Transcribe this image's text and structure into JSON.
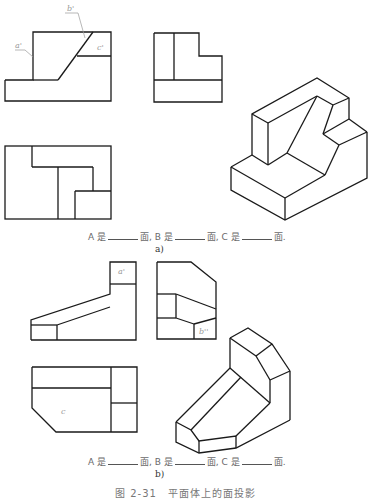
{
  "figure_a": {
    "labels": {
      "a": "a'",
      "b": "b'",
      "c": "c'"
    },
    "question": {
      "A": "A 是",
      "B": "面, B 是",
      "C": "面, C 是",
      "end": "面."
    },
    "sublabel": "a)"
  },
  "figure_b": {
    "labels": {
      "a": "a'",
      "b": "b''",
      "c": "c"
    },
    "question": {
      "A": "A 是",
      "B": "面, B 是",
      "C": "面, C 是",
      "end": "面."
    },
    "sublabel": "b)"
  },
  "caption": "图 2-31　平面体上的面投影",
  "colors": {
    "line": "#1a1a1a",
    "leader": "#9a9a9a",
    "text": "#6a6a6a"
  }
}
